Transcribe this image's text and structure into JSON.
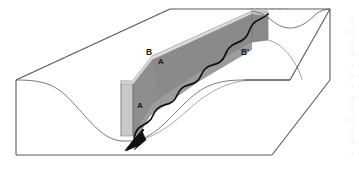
{
  "figure": {
    "type": "geologic-block-diagram",
    "width": 359,
    "height": 170,
    "background_color": "#ffffff"
  },
  "labels": [
    {
      "id": "section-line-a-top",
      "text": "A",
      "x": 160,
      "y": 63,
      "style": "label-a",
      "description": "Upper end of cross-section line A on the inclined cut panel"
    },
    {
      "id": "section-line-a-front",
      "text": "A",
      "x": 140,
      "y": 106,
      "style": "label-a",
      "description": "Lower end of cross-section line A on the vertical cut face"
    },
    {
      "id": "section-line-b",
      "text": "B",
      "x": 149,
      "y": 55,
      "style": "label-b",
      "description": "Left end of longitudinal section line B on the upland surface"
    },
    {
      "id": "section-line-b-prime",
      "text": "B'",
      "x": 245,
      "y": 55,
      "style": "label-b",
      "description": "Right end of longitudinal section line B prime on the upland surface"
    }
  ],
  "colors": {
    "outline": "#5a5a5a",
    "hidden_edge": "#9a9a9a",
    "cut_face_light": "#c9c9c9",
    "cut_face_mid": "#b5b5b5",
    "cut_face_dark": "#8e8e8e",
    "cut_face_darkest": "#787878",
    "channel_line": "#111111",
    "arrow_fill": "#111111",
    "label_text": "#1a1a1a",
    "margin_artifact": "#d8d8d8"
  },
  "elements": {
    "block_outline_name": "block-outline",
    "top_surface_name": "upland-top-surface",
    "front_face_name": "block-front-face",
    "right_face_name": "block-right-face",
    "valley_curve_front_name": "valley-profile-front-face",
    "valley_curve_top_name": "valley-profile-top-surface",
    "cross_section_panel_name": "cross-section-panel-a",
    "longitudinal_panel_name": "longitudinal-section-panel-b",
    "stream_channel_name": "stream-channel-wavy-line",
    "flow_arrow_name": "stream-flow-direction-arrow",
    "hidden_edges_name": "hidden-edges-dashed"
  }
}
